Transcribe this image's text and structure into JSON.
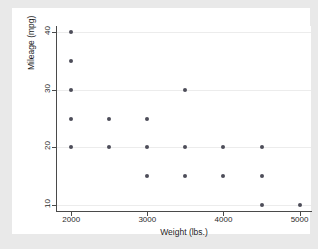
{
  "chart_data": {
    "type": "scatter",
    "title": "",
    "xlabel": "Weight (lbs.)",
    "ylabel": "Mileage (mpg)",
    "xlim": [
      1800,
      5150
    ],
    "ylim": [
      9,
      41
    ],
    "xticks": [
      2000,
      3000,
      4000,
      5000
    ],
    "xtick_labels": [
      "2000",
      "3000",
      "4000",
      "5000"
    ],
    "yticks": [
      10,
      20,
      30,
      40
    ],
    "ytick_labels": [
      "10",
      "20",
      "30",
      "40"
    ],
    "grid": "horizontal",
    "gridlines_y": [
      10,
      20,
      30,
      40
    ],
    "legend": null,
    "marker": {
      "shape": "circle",
      "color": "#4d4d59",
      "size_px": 4
    },
    "points": [
      {
        "x": 2000,
        "y": 40
      },
      {
        "x": 2000,
        "y": 35
      },
      {
        "x": 2000,
        "y": 30
      },
      {
        "x": 2000,
        "y": 25
      },
      {
        "x": 2000,
        "y": 20
      },
      {
        "x": 2500,
        "y": 25
      },
      {
        "x": 2500,
        "y": 20
      },
      {
        "x": 3000,
        "y": 25
      },
      {
        "x": 3000,
        "y": 20
      },
      {
        "x": 3000,
        "y": 15
      },
      {
        "x": 3500,
        "y": 30
      },
      {
        "x": 3500,
        "y": 20
      },
      {
        "x": 3500,
        "y": 15
      },
      {
        "x": 4000,
        "y": 20
      },
      {
        "x": 4000,
        "y": 15
      },
      {
        "x": 4500,
        "y": 20
      },
      {
        "x": 4500,
        "y": 15
      },
      {
        "x": 4500,
        "y": 10
      },
      {
        "x": 5000,
        "y": 10
      }
    ]
  },
  "figure": {
    "background_color": "#e9e9e9",
    "panel_color": "#ffffff",
    "axis_color": "#4a4a4a",
    "grid_color": "#ececec"
  }
}
